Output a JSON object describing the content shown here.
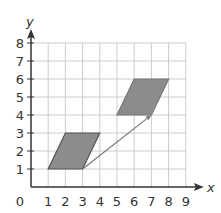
{
  "figure": {
    "type": "coordinate-grid translation",
    "x_axis_label": "x",
    "y_axis_label": "y",
    "origin_label": "0",
    "x_ticks": [
      "1",
      "2",
      "3",
      "4",
      "5",
      "6",
      "7",
      "8",
      "9"
    ],
    "y_ticks": [
      "1",
      "2",
      "3",
      "4",
      "5",
      "6",
      "7",
      "8"
    ],
    "grid": {
      "x_min": 0,
      "x_max": 9,
      "y_min": 0,
      "y_max": 8
    },
    "shapes": [
      {
        "name": "original-parallelogram",
        "vertices": [
          [
            1,
            1
          ],
          [
            3,
            1
          ],
          [
            4,
            3
          ],
          [
            2,
            3
          ]
        ],
        "fill": "#8c8c8c",
        "stroke": "#555555"
      },
      {
        "name": "translated-parallelogram",
        "vertices": [
          [
            5,
            4
          ],
          [
            7,
            4
          ],
          [
            8,
            6
          ],
          [
            6,
            6
          ]
        ],
        "fill": "#8c8c8c",
        "stroke": "#777777"
      }
    ],
    "translation_vector": {
      "from": [
        3,
        1
      ],
      "to": [
        7,
        4
      ],
      "color": "#777777"
    },
    "colors": {
      "grid": "#cccccc",
      "axis": "#333333"
    }
  }
}
